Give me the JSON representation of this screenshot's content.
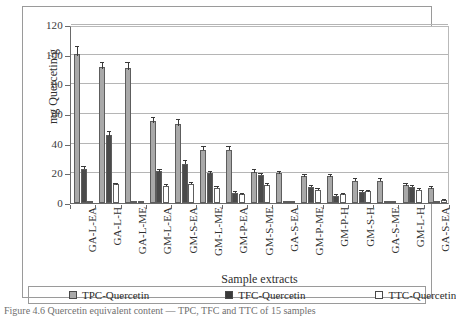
{
  "figure": {
    "caption": "Figure 4.6  Quercetin equivalent content — TPC, TFC and TTC of 15 samples"
  },
  "chart_data": {
    "type": "bar",
    "title": "",
    "xlabel": "Sample extracts",
    "ylabel": "mg Quercetin/g",
    "ylim": [
      0,
      120
    ],
    "yticks": [
      0,
      20,
      40,
      60,
      80,
      100,
      120
    ],
    "grid": true,
    "legend_position": "bottom",
    "categories": [
      "GA-L-EA",
      "GA-L-H",
      "GA-L-ME",
      "GM-L-EA",
      "GM-S-EA",
      "GM-L-ME",
      "GM-P-EA",
      "GM-S-ME",
      "GA-S-EA",
      "GM-P-ME",
      "GM-P-H",
      "GM-S-H",
      "GA-S-ME",
      "GM-L-H",
      "GA-S-EA"
    ],
    "series": [
      {
        "name": "TPC-Quercetin",
        "color": "#a9a9a9",
        "values": [
          100.5,
          91.5,
          91.0,
          55.0,
          53.0,
          36.0,
          36.0,
          21.0,
          20.0,
          18.0,
          18.0,
          15.0,
          15.0,
          12.0,
          10.0
        ],
        "errors": [
          4.5,
          3.0,
          3.5,
          2.5,
          3.0,
          1.5,
          1.5,
          1.5,
          1.0,
          1.0,
          1.0,
          1.0,
          1.0,
          0.8,
          0.8
        ]
      },
      {
        "name": "TFC-Quercetin",
        "color": "#4a4a4a",
        "values": [
          23.0,
          46.0,
          1.0,
          21.5,
          26.5,
          20.0,
          7.0,
          19.0,
          0.4,
          11.0,
          5.0,
          7.5,
          0.6,
          11.0,
          0.3
        ],
        "errors": [
          1.0,
          2.0,
          0.3,
          1.0,
          1.5,
          0.8,
          0.5,
          0.8,
          0.2,
          0.6,
          0.4,
          0.5,
          0.2,
          0.6,
          0.2
        ]
      },
      {
        "name": "TTC-Quercetin",
        "color": "#ffffff",
        "values": [
          0.3,
          12.5,
          0.4,
          11.5,
          13.0,
          10.0,
          6.0,
          12.0,
          1.2,
          9.0,
          6.0,
          8.0,
          1.0,
          9.0,
          2.0
        ],
        "errors": [
          0.2,
          0.6,
          0.2,
          0.6,
          0.7,
          0.5,
          0.4,
          0.6,
          0.3,
          0.5,
          0.4,
          0.4,
          0.3,
          0.5,
          0.3
        ]
      }
    ]
  }
}
